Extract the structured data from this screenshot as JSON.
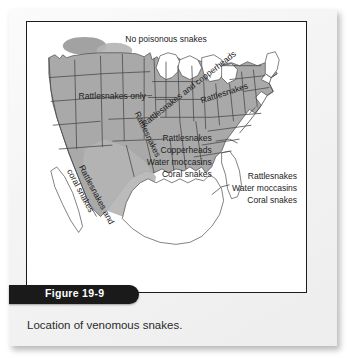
{
  "figure": {
    "badge_label": "Figure 19-9",
    "caption": "Location of venomous snakes."
  },
  "map": {
    "title_region": "United States",
    "labels": {
      "no_poisonous": "No poisonous snakes",
      "rattlesnakes_only": "Rattlesnakes only",
      "rattlesnakes_diag": "Rattlesnakes",
      "rattlesnakes_and_copperheads": "Rattlesnakes and copperheads",
      "rattlesnakes_ne": "Rattlesnakes",
      "copperheads_ne": "copperheads",
      "rattlesnakes_and_coral": "Rattlesnakes and",
      "coral_snakes_sw": "coral snakes",
      "southeast": [
        "Rattlesnakes",
        "Copperheads",
        "Water moccasins",
        "Coral snakes"
      ],
      "florida": [
        "Rattlesnakes",
        "Water moccasins",
        "Coral snakes"
      ]
    },
    "colors": {
      "shaded_region": "#a9a9a9",
      "unshaded_region": "#ffffff",
      "state_border": "#4a4a4a",
      "map_frame": "#1c1c1c",
      "badge_background": "#1a1a1a",
      "badge_text": "#ffffff",
      "page_background": "#f2f2f2"
    }
  }
}
